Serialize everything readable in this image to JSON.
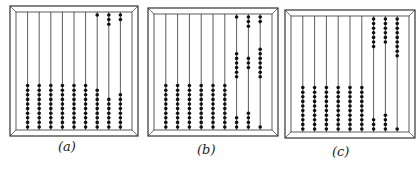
{
  "figures": [
    {
      "id": "a",
      "caption": "(a)",
      "frame": {
        "x": 10,
        "y": 6,
        "w": 128,
        "h": 130
      },
      "rods": [
        {
          "top": 0,
          "bottom": 10
        },
        {
          "top": 0,
          "bottom": 10
        },
        {
          "top": 0,
          "bottom": 10
        },
        {
          "top": 0,
          "bottom": 10
        },
        {
          "top": 0,
          "bottom": 10
        },
        {
          "top": 0,
          "bottom": 10
        },
        {
          "top": 1,
          "bottom": 9
        },
        {
          "top": 3,
          "bottom": 7
        },
        {
          "top": 2,
          "bottom": 8
        }
      ],
      "caption_pos": {
        "x": 64,
        "y": 147
      }
    },
    {
      "id": "b",
      "caption": "(b)",
      "frame": {
        "x": 148,
        "y": 8,
        "w": 130,
        "h": 128
      },
      "rods": [
        {
          "top": 0,
          "bottom": 10
        },
        {
          "top": 0,
          "bottom": 10
        },
        {
          "top": 0,
          "bottom": 10
        },
        {
          "top": 0,
          "bottom": 10
        },
        {
          "top": 0,
          "bottom": 10
        },
        {
          "top": 0,
          "bottom": 10
        },
        {
          "top": 1,
          "mid": 6,
          "midStart": 6,
          "bottom": 3
        },
        {
          "top": 3,
          "mid": 3,
          "midStart": 7,
          "bottom": 4
        },
        {
          "top": 2,
          "mid": 7,
          "midStart": 5,
          "bottom": 1
        }
      ],
      "caption_pos": {
        "x": 203,
        "y": 150
      }
    },
    {
      "id": "c",
      "caption": "(c)",
      "frame": {
        "x": 285,
        "y": 10,
        "w": 130,
        "h": 128
      },
      "rods": [
        {
          "top": 0,
          "bottom": 10
        },
        {
          "top": 0,
          "bottom": 10
        },
        {
          "top": 0,
          "bottom": 10
        },
        {
          "top": 0,
          "bottom": 10
        },
        {
          "top": 0,
          "bottom": 10
        },
        {
          "top": 0,
          "bottom": 10
        },
        {
          "top": 7,
          "bottom": 3
        },
        {
          "top": 6,
          "bottom": 4
        },
        {
          "top": 9,
          "bottom": 1
        }
      ],
      "caption_pos": {
        "x": 338,
        "y": 152
      }
    }
  ],
  "colors": {
    "line": "#333333",
    "bead": "#111111",
    "background": "#ffffff"
  }
}
